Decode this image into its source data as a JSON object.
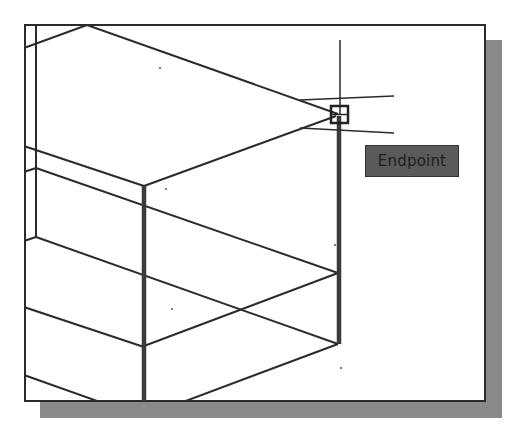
{
  "canvas": {
    "width": 527,
    "height": 438,
    "background": "#ffffff"
  },
  "viewport": {
    "frame": {
      "x": 24,
      "y": 24,
      "w": 462,
      "h": 378
    },
    "shadow_color": "#8a8a8a",
    "line_color": "#2b2b2b"
  },
  "drawing": {
    "thin_lines": [
      {
        "x1": 36,
        "y1": 24,
        "x2": 36,
        "y2": 238
      },
      {
        "x1": 24,
        "y1": 48,
        "x2": 87,
        "y2": 25
      },
      {
        "x1": 87,
        "y1": 25,
        "x2": 338,
        "y2": 114
      },
      {
        "x1": 24,
        "y1": 146,
        "x2": 144,
        "y2": 186
      },
      {
        "x1": 144,
        "y1": 186,
        "x2": 336,
        "y2": 116
      },
      {
        "x1": 24,
        "y1": 172,
        "x2": 36,
        "y2": 168
      },
      {
        "x1": 36,
        "y1": 168,
        "x2": 338,
        "y2": 273
      },
      {
        "x1": 24,
        "y1": 241,
        "x2": 36,
        "y2": 237
      },
      {
        "x1": 36,
        "y1": 237,
        "x2": 338,
        "y2": 344
      },
      {
        "x1": 144,
        "y1": 346,
        "x2": 338,
        "y2": 273
      },
      {
        "x1": 24,
        "y1": 307,
        "x2": 144,
        "y2": 347
      },
      {
        "x1": 24,
        "y1": 375,
        "x2": 100,
        "y2": 402
      },
      {
        "x1": 338,
        "y1": 344,
        "x2": 183,
        "y2": 402
      }
    ],
    "thick_lines": [
      {
        "x1": 144,
        "y1": 186,
        "x2": 144,
        "y2": 402
      },
      {
        "x1": 339,
        "y1": 116,
        "x2": 339,
        "y2": 344
      }
    ],
    "dots": [
      {
        "x": 160,
        "y": 68
      },
      {
        "x": 166,
        "y": 189
      },
      {
        "x": 172,
        "y": 309
      },
      {
        "x": 335,
        "y": 245
      },
      {
        "x": 341,
        "y": 368
      }
    ]
  },
  "cursor": {
    "center": {
      "x": 339,
      "y": 114
    },
    "vertical": {
      "x1": 340,
      "y1": 40,
      "x2": 340,
      "y2": 114
    },
    "iso_axes": [
      {
        "x1": 300,
        "y1": 100,
        "x2": 394,
        "y2": 96
      },
      {
        "x1": 300,
        "y1": 128,
        "x2": 394,
        "y2": 133
      }
    ],
    "snap_marker": {
      "x": 331,
      "y": 106,
      "size": 17
    }
  },
  "tooltip": {
    "label": "Endpoint",
    "background": "#5a5a5a"
  }
}
